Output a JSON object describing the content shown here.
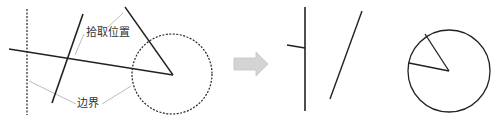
{
  "diagram": {
    "labels": {
      "pick_position": "拾取位置",
      "boundary": "边界"
    },
    "icons": {
      "transition_arrow": "right-arrow-icon"
    },
    "colors": {
      "stroke": "#222222",
      "leader": "#bdbdbd",
      "arrow": "#cfcfcf",
      "background": "#ffffff"
    },
    "before": {
      "description": "Objects with trim boundary and pick positions",
      "boundary_line": {
        "x1": 27,
        "y1": 9,
        "x2": 27,
        "y2": 115,
        "style": "dashed"
      },
      "long_line": {
        "x1": 9,
        "y1": 49,
        "x2": 173,
        "y2": 75
      },
      "diagonal_line": {
        "x1": 52,
        "y1": 103,
        "x2": 83,
        "y2": 14
      },
      "radius_line": {
        "x1": 125,
        "y1": 7,
        "x2": 173,
        "y2": 75
      },
      "boundary_circle": {
        "cx": 172,
        "cy": 74,
        "r": 40,
        "style": "dashed"
      }
    },
    "after": {
      "description": "Result after trimming",
      "vertical_line": {
        "x1": 305,
        "y1": 7,
        "x2": 305,
        "y2": 111
      },
      "stub_line": {
        "x1": 287,
        "y1": 45,
        "x2": 305,
        "y2": 48
      },
      "diagonal_line": {
        "x1": 330,
        "y1": 99,
        "x2": 362,
        "y2": 11
      },
      "circle": {
        "cx": 449,
        "cy": 71,
        "r": 41
      },
      "wedge_radius_1": {
        "x1": 449,
        "y1": 71,
        "x2": 425,
        "y2": 34
      },
      "wedge_radius_2": {
        "x1": 449,
        "y1": 71,
        "x2": 409,
        "y2": 63
      }
    }
  }
}
